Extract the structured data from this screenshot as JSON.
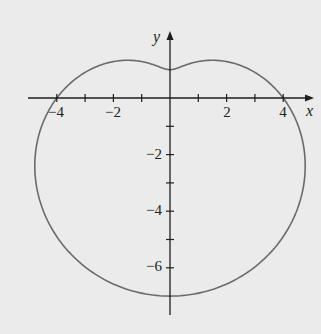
{
  "chart_data": {
    "type": "line",
    "title": "",
    "xlabel": "x",
    "ylabel": "y",
    "xlim": [
      -5,
      5
    ],
    "ylim": [
      -7.5,
      2.3
    ],
    "grid": false,
    "legend": null,
    "x_ticks": [
      -4,
      -3,
      -2,
      -1,
      1,
      2,
      3,
      4
    ],
    "x_tick_labels": [
      "-4",
      "-2",
      "2",
      "4"
    ],
    "x_tick_label_values": [
      -4,
      -2,
      2,
      4
    ],
    "y_ticks": [
      -1,
      -2,
      -3,
      -4,
      -5,
      -6
    ],
    "y_tick_labels": [
      "-2",
      "-4",
      "-6"
    ],
    "y_tick_label_values": [
      -2,
      -4,
      -6
    ],
    "series": [
      {
        "name": "r = 4 - 3 sin θ",
        "key_points": [
          {
            "x": 4,
            "y": 0
          },
          {
            "x": 1.3,
            "y": 1.3
          },
          {
            "x": 0,
            "y": 1
          },
          {
            "x": -1.3,
            "y": 1.3
          },
          {
            "x": -4,
            "y": 0
          },
          {
            "x": -4.85,
            "y": -2.2
          },
          {
            "x": 0,
            "y": -7
          },
          {
            "x": 4.85,
            "y": -2.2
          }
        ]
      }
    ]
  },
  "labels": {
    "x_axis": "x",
    "y_axis": "y",
    "x_ticks": [
      "−4",
      "−2",
      "2",
      "4"
    ],
    "y_ticks": [
      "−2",
      "−4",
      "−6"
    ]
  },
  "style": {
    "background": "#ebebeb",
    "curve_color": "#6a6a6a",
    "axis_color": "#1e1e1e"
  }
}
